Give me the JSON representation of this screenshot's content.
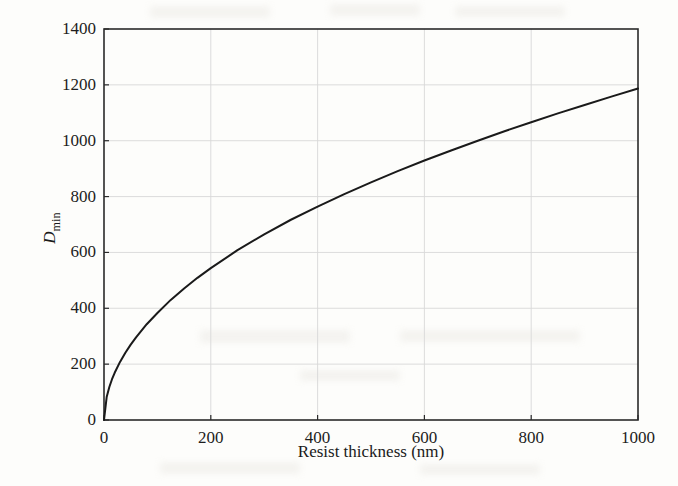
{
  "chart_data": {
    "type": "line",
    "title": "",
    "subtitle": "",
    "xlabel": "Resist thickness (nm)",
    "ylabel": "D_min",
    "ylabel_base": "D",
    "ylabel_subscript": "min",
    "xlim": [
      0,
      1000
    ],
    "ylim": [
      0,
      1400
    ],
    "xticks": [
      0,
      200,
      400,
      600,
      800,
      1000
    ],
    "yticks": [
      0,
      200,
      400,
      600,
      800,
      1000,
      1200,
      1400
    ],
    "xtick_labels": [
      "0",
      "200",
      "400",
      "600",
      "800",
      "1000"
    ],
    "ytick_labels": [
      "0",
      "200",
      "400",
      "600",
      "800",
      "1000",
      "1200",
      "1400"
    ],
    "grid": true,
    "legend": false,
    "legend_position": "none",
    "line_color": "#1a1a1a",
    "line_width": 2.0,
    "grid_color": "#d8d8d8",
    "axis_color": "#2a2a2a",
    "background_color": "#fdfdfb",
    "series": [
      {
        "name": "D_min vs resist thickness",
        "x": [
          0,
          5,
          10,
          15,
          20,
          30,
          40,
          50,
          60,
          80,
          100,
          125,
          150,
          175,
          200,
          250,
          300,
          350,
          400,
          450,
          500,
          550,
          600,
          650,
          700,
          750,
          800,
          850,
          900,
          950,
          1000
        ],
        "y": [
          0,
          82,
          118,
          146,
          169,
          208,
          241,
          270,
          296,
          343,
          383,
          430,
          471,
          509,
          544,
          608,
          665,
          717,
          764,
          809,
          851,
          891,
          929,
          965,
          1000,
          1034,
          1066,
          1098,
          1128,
          1158,
          1187
        ]
      }
    ],
    "annotations": []
  },
  "axes": {
    "x_title": "Resist thickness (nm)",
    "y_title_base": "D",
    "y_title_sub": "min"
  }
}
